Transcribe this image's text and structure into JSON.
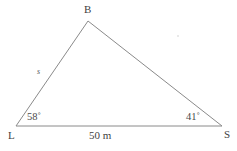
{
  "figure": {
    "type": "triangle-diagram",
    "background_color": "#ffffff",
    "stroke_color": "#8a8a8a",
    "text_color": "#4a4a4a"
  },
  "vertices": {
    "apex": {
      "label": "B",
      "x": 88,
      "y": 21
    },
    "left": {
      "label": "L",
      "x": 16,
      "y": 126
    },
    "right": {
      "label": "S",
      "x": 222,
      "y": 126
    }
  },
  "angles": {
    "at_left": "58˚",
    "at_right": "41˚"
  },
  "sides": {
    "left_side": "s",
    "base": "50 m"
  }
}
